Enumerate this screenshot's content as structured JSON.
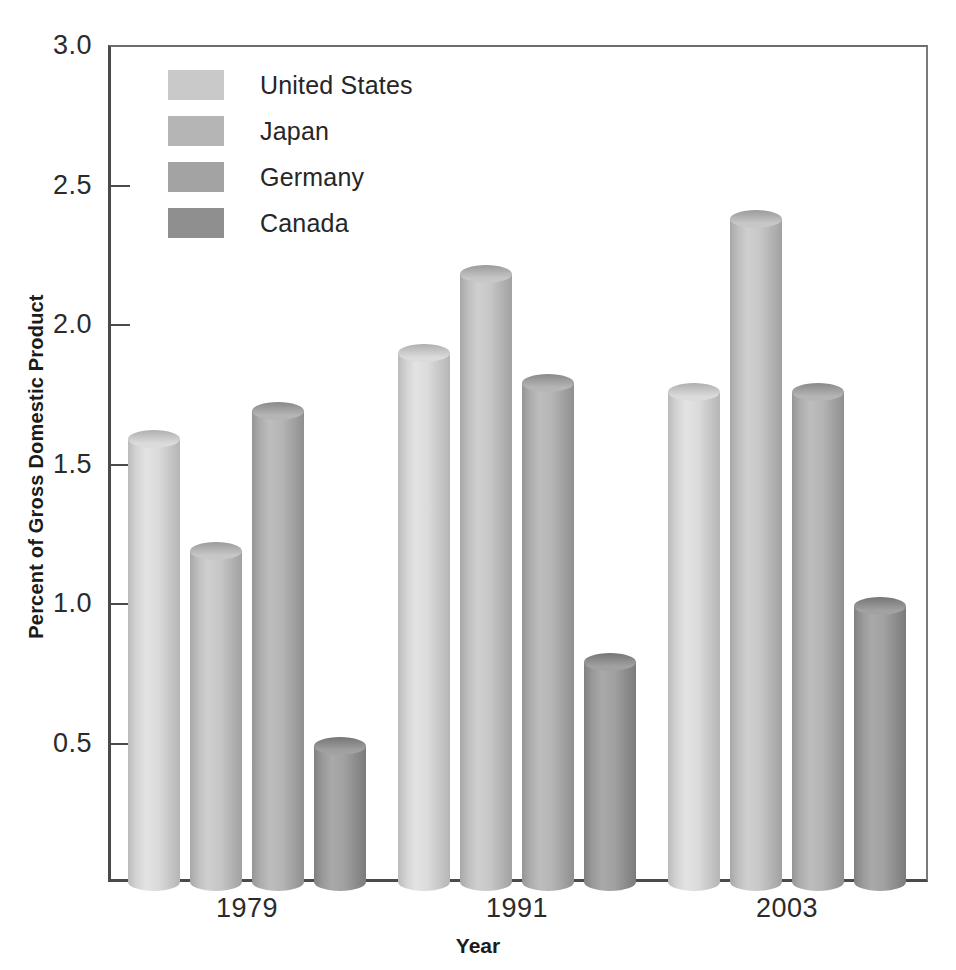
{
  "chart_data": {
    "type": "bar",
    "title": "",
    "subtitle": "",
    "xlabel": "Year",
    "ylabel": "Percent of Gross Domestic Product",
    "categories": [
      "1979",
      "1991",
      "2003"
    ],
    "series": [
      {
        "name": "United States",
        "values": [
          1.62,
          1.93,
          1.79
        ],
        "color": "#c9c9c9"
      },
      {
        "name": "Japan",
        "values": [
          1.22,
          2.21,
          2.41
        ],
        "color": "#b5b5b5"
      },
      {
        "name": "Germany",
        "values": [
          1.72,
          1.82,
          1.79
        ],
        "color": "#a3a3a3"
      },
      {
        "name": "Canada",
        "values": [
          0.52,
          0.82,
          1.02
        ],
        "color": "#8f8f8f"
      }
    ],
    "ylim": [
      0,
      3.0
    ],
    "yticks": [
      "0.5",
      "1.0",
      "1.5",
      "2.0",
      "2.5",
      "3.0"
    ],
    "ytick_values": [
      0.5,
      1.0,
      1.5,
      2.0,
      2.5,
      3.0
    ],
    "grid": false,
    "legend_position": "top-left",
    "bar_style": "3d-cylinder"
  },
  "axis": {
    "y_title": "Percent of Gross Domestic Product",
    "x_title": "Year"
  },
  "legend": {
    "items": [
      {
        "label": "United States"
      },
      {
        "label": "Japan"
      },
      {
        "label": "Germany"
      },
      {
        "label": "Canada"
      }
    ]
  }
}
